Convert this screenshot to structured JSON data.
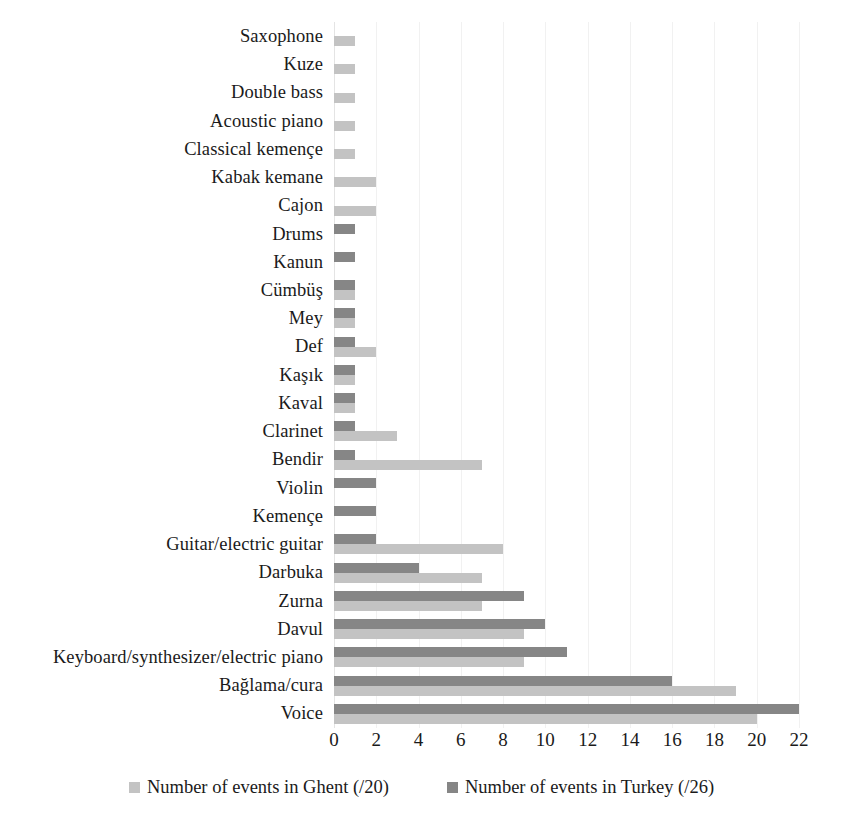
{
  "chart_data": {
    "type": "bar",
    "orientation": "horizontal",
    "title": "",
    "subtitle": "",
    "xlabel": "",
    "ylabel": "",
    "xlim": [
      0,
      22
    ],
    "xticks": [
      0,
      2,
      4,
      6,
      8,
      10,
      12,
      14,
      16,
      18,
      20,
      22
    ],
    "xtick_labels": [
      "0",
      "2",
      "4",
      "6",
      "8",
      "10",
      "12",
      "14",
      "16",
      "18",
      "20",
      "22"
    ],
    "grid": true,
    "grid_axis": "x",
    "legend_position": "bottom",
    "categories": [
      "Saxophone",
      "Kuze",
      "Double bass",
      "Acoustic piano",
      "Classical kemençe",
      "Kabak kemane",
      "Cajon",
      "Drums",
      "Kanun",
      "Cümbüş",
      "Mey",
      "Def",
      "Kaşık",
      "Kaval",
      "Clarinet",
      "Bendir",
      "Violin",
      "Kemençe",
      "Guitar/electric guitar",
      "Darbuka",
      "Zurna",
      "Davul",
      "Keyboard/synthesizer/electric piano",
      "Bağlama/cura",
      "Voice"
    ],
    "series": [
      {
        "name": "Number of events in Ghent (/20)",
        "color": "#c3c3c3",
        "values": [
          1,
          1,
          1,
          1,
          1,
          2,
          2,
          0,
          0,
          1,
          1,
          2,
          1,
          1,
          3,
          7,
          0,
          0,
          8,
          7,
          7,
          9,
          9,
          19,
          20
        ]
      },
      {
        "name": "Number of events in Turkey (/26)",
        "color": "#868686",
        "values": [
          0,
          0,
          0,
          0,
          0,
          0,
          0,
          1,
          1,
          1,
          1,
          1,
          1,
          1,
          1,
          1,
          2,
          2,
          2,
          4,
          9,
          10,
          11,
          16,
          22
        ]
      }
    ]
  },
  "legend": {
    "items": [
      {
        "label": "Number of events in Ghent (/20)",
        "color": "#c3c3c3"
      },
      {
        "label": "Number of events in Turkey (/26)",
        "color": "#868686"
      }
    ]
  }
}
